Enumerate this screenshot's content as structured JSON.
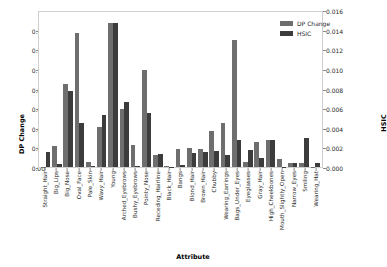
{
  "chart_data": {
    "type": "bar",
    "title": "",
    "xlabel": "Attribute",
    "ylabel": "DP Change",
    "ylabel_right": "HSIC",
    "ylim": [
      0.0,
      0.16
    ],
    "ylim_right": [
      0.0,
      0.016
    ],
    "yticks": [
      "0.00",
      "0.02",
      "0.04",
      "0.06",
      "0.08",
      "0.10",
      "0.12",
      "0.14"
    ],
    "ytick_values": [
      0.0,
      0.02,
      0.04,
      0.06,
      0.08,
      0.1,
      0.12,
      0.14
    ],
    "yticks_right": [
      "0.000",
      "0.002",
      "0.004",
      "0.006",
      "0.008",
      "0.010",
      "0.012",
      "0.014",
      "0.016"
    ],
    "ytick_values_right": [
      0.0,
      0.002,
      0.004,
      0.006,
      0.008,
      0.01,
      0.012,
      0.014,
      0.016
    ],
    "grid": false,
    "legend_position": "top-right",
    "categories": [
      "Straight_Hair",
      "Big_Lips",
      "Big_Nose",
      "Oval_Face",
      "Pale_Skin",
      "Wavy_Hair",
      "Young",
      "Arched_Eyebrows",
      "Bushy_Eyebrows",
      "Pointy_Nose",
      "Receding_Hairline",
      "Black_Hair",
      "Bangs",
      "Blond_Hair",
      "Brown_Hair",
      "Chubby",
      "Wearing_Earrings",
      "Bags_Under_Eyes",
      "Eyeglasses",
      "Gray_Hair",
      "High_Cheekbones",
      "Mouth_Slightly_Open",
      "Narrow_Eyes",
      "Smiling",
      "Wearing_Hat"
    ],
    "series": [
      {
        "name": "DP Change",
        "color": "#6e6e6e",
        "axis": "left",
        "values": [
          0.0005,
          0.0215,
          0.0845,
          0.1365,
          0.005,
          0.041,
          0.147,
          0.059,
          0.022,
          0.099,
          0.0125,
          0.001,
          0.0185,
          0.019,
          0.018,
          0.037,
          0.0445,
          0.129,
          0.005,
          0.025,
          0.028,
          0.0085,
          0.004,
          0.004,
          0.0005
        ]
      },
      {
        "name": "HSIC",
        "color": "#3c3c3c",
        "axis": "right",
        "values": [
          0.00155,
          0.0003,
          0.0077,
          0.0045,
          0.00015,
          0.00535,
          0.0147,
          0.00665,
          0.00015,
          0.00555,
          0.00135,
          5e-05,
          0.0002,
          0.00145,
          0.0015,
          0.00165,
          0.00125,
          0.00275,
          0.0017,
          0.0009,
          0.0028,
          5e-05,
          0.0004,
          0.00295,
          0.0004
        ]
      }
    ]
  },
  "legend": {
    "items": [
      {
        "label": "DP Change"
      },
      {
        "label": "HSIC"
      }
    ]
  }
}
